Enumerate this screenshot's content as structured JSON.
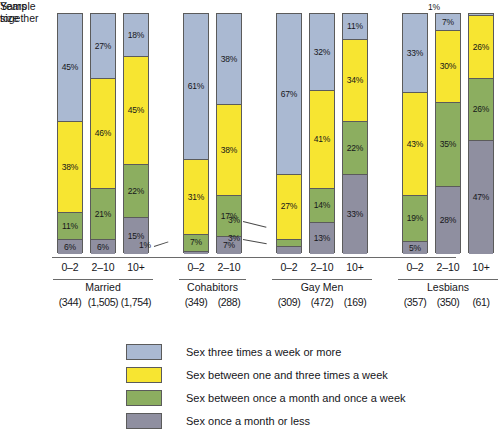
{
  "axis": {
    "years_label_line1": "Years",
    "years_label_line2": "together",
    "sample_label_line1": "Sample",
    "sample_label_line2": "size"
  },
  "legend": {
    "items": [
      {
        "label": "Sex three times a week or more",
        "color": "#aab9d2",
        "name": "legend-three-times-week"
      },
      {
        "label": "Sex between one and three times a week",
        "color": "#f7e531",
        "name": "legend-one-to-three-week"
      },
      {
        "label": "Sex between once a month and once a week",
        "color": "#8cae60",
        "name": "legend-month-to-week"
      },
      {
        "label": "Sex once a month or less",
        "color": "#8f8fa0",
        "name": "legend-once-month-or-less"
      }
    ]
  },
  "callouts": {
    "cohabitors_0_2_bottom": "1%",
    "gay_0_2_green": "3%",
    "gay_0_2_grey": "3%",
    "lesbians_10plus_top": "1%"
  },
  "chart_data": {
    "type": "bar",
    "subtype": "stacked-percentage",
    "title": "",
    "xlabel": "Years together",
    "ylabel": "",
    "ylim": [
      0,
      100
    ],
    "grid": false,
    "legend_position": "bottom",
    "series": [
      {
        "name": "Sex three times a week or more",
        "color": "#aab9d2",
        "values": [
          45,
          27,
          18,
          61,
          38,
          67,
          32,
          11,
          33,
          7,
          1
        ]
      },
      {
        "name": "Sex between one and three times a week",
        "color": "#f7e531",
        "values": [
          38,
          46,
          45,
          31,
          38,
          27,
          41,
          34,
          43,
          30,
          26
        ]
      },
      {
        "name": "Sex between once a month and once a week",
        "color": "#8cae60",
        "values": [
          11,
          21,
          22,
          7,
          17,
          3,
          14,
          22,
          19,
          35,
          26
        ]
      },
      {
        "name": "Sex once a month or less",
        "color": "#8f8fa0",
        "values": [
          6,
          6,
          15,
          1,
          7,
          3,
          13,
          33,
          5,
          28,
          47
        ]
      }
    ],
    "groups": [
      {
        "name": "Married",
        "bars": [
          {
            "years": "0–2",
            "sample": "(344)",
            "values": [
              45,
              38,
              11,
              6
            ],
            "labels": [
              "45%",
              "38%",
              "11%",
              "6%"
            ]
          },
          {
            "years": "2–10",
            "sample": "(1,505)",
            "values": [
              27,
              46,
              21,
              6
            ],
            "labels": [
              "27%",
              "46%",
              "21%",
              "6%"
            ]
          },
          {
            "years": "10+",
            "sample": "(1,754)",
            "values": [
              18,
              45,
              22,
              15
            ],
            "labels": [
              "18%",
              "45%",
              "22%",
              "15%"
            ]
          }
        ]
      },
      {
        "name": "Cohabitors",
        "bars": [
          {
            "years": "0–2",
            "sample": "(349)",
            "values": [
              61,
              31,
              7,
              1
            ],
            "labels": [
              "61%",
              "31%",
              "7%",
              ""
            ]
          },
          {
            "years": "2–10",
            "sample": "(288)",
            "values": [
              38,
              38,
              17,
              7
            ],
            "labels": [
              "38%",
              "38%",
              "17%",
              "7%"
            ]
          }
        ]
      },
      {
        "name": "Gay Men",
        "bars": [
          {
            "years": "0–2",
            "sample": "(309)",
            "values": [
              67,
              27,
              3,
              3
            ],
            "labels": [
              "67%",
              "27%",
              "",
              ""
            ]
          },
          {
            "years": "2–10",
            "sample": "(472)",
            "values": [
              32,
              41,
              14,
              13
            ],
            "labels": [
              "32%",
              "41%",
              "14%",
              "13%"
            ]
          },
          {
            "years": "10+",
            "sample": "(169)",
            "values": [
              11,
              34,
              22,
              33
            ],
            "labels": [
              "11%",
              "34%",
              "22%",
              "33%"
            ]
          }
        ]
      },
      {
        "name": "Lesbians",
        "bars": [
          {
            "years": "0–2",
            "sample": "(357)",
            "values": [
              33,
              43,
              19,
              5
            ],
            "labels": [
              "33%",
              "43%",
              "19%",
              "5%"
            ]
          },
          {
            "years": "2–10",
            "sample": "(350)",
            "values": [
              7,
              30,
              35,
              28
            ],
            "labels": [
              "7%",
              "30%",
              "35%",
              "28%"
            ]
          },
          {
            "years": "10+",
            "sample": "(61)",
            "values": [
              1,
              26,
              26,
              47
            ],
            "labels": [
              "",
              "26%",
              "26%",
              "47%"
            ]
          }
        ]
      }
    ]
  }
}
